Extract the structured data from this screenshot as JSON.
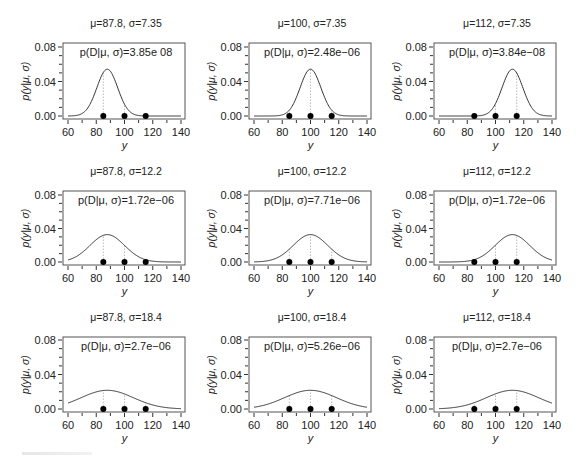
{
  "figure": {
    "rows": 3,
    "cols": 3,
    "colors": {
      "curve": "#333333",
      "axis": "#333333",
      "box": "#555555",
      "dots": "#000000",
      "guide": "#bbbbbb",
      "text": "#222222"
    }
  },
  "chart_data": {
    "type": "line",
    "data_points_y": [
      85,
      100,
      115
    ],
    "xlabel": "y",
    "ylabel": "p(y|μ, σ)",
    "xlim": [
      60,
      140
    ],
    "ylim": [
      0,
      0.08
    ],
    "xticks": [
      60,
      80,
      100,
      120,
      140
    ],
    "xtick_labels": [
      "60",
      "80",
      "100",
      "120",
      "140"
    ],
    "yticks": [
      0,
      0.04,
      0.08
    ],
    "ytick_labels": [
      "0.00",
      "0.04",
      "0.08"
    ],
    "grid": false,
    "panels": [
      {
        "row": 0,
        "col": 0,
        "mu": 87.8,
        "sigma": 7.35,
        "title": "μ=87.8, σ=7.35",
        "likelihood": "p(D|μ, σ)=3.85e 08",
        "show_xlabel": true
      },
      {
        "row": 0,
        "col": 1,
        "mu": 100,
        "sigma": 7.35,
        "title": "μ=100, σ=7.35",
        "likelihood": "p(D|μ, σ)=2.48e−06",
        "show_xlabel": true
      },
      {
        "row": 0,
        "col": 2,
        "mu": 112,
        "sigma": 7.35,
        "title": "μ=112, σ=7.35",
        "likelihood": "p(D|μ, σ)=3.84e−08",
        "show_xlabel": true
      },
      {
        "row": 1,
        "col": 0,
        "mu": 87.8,
        "sigma": 12.2,
        "title": "μ=87.8, σ=12.2",
        "likelihood": "p(D|μ, σ)=1.72e−06",
        "show_xlabel": true
      },
      {
        "row": 1,
        "col": 1,
        "mu": 100,
        "sigma": 12.2,
        "title": "μ=100, σ=12.2",
        "likelihood": "p(D|μ, σ)=7.71e−06",
        "show_xlabel": true
      },
      {
        "row": 1,
        "col": 2,
        "mu": 112,
        "sigma": 12.2,
        "title": "μ=112, σ=12.2",
        "likelihood": "p(D|μ, σ)=1.72e−06",
        "show_xlabel": true
      },
      {
        "row": 2,
        "col": 0,
        "mu": 87.8,
        "sigma": 18.4,
        "title": "μ=87.8, σ=18.4",
        "likelihood": "p(D|μ, σ)=2.7e−06",
        "show_xlabel": true
      },
      {
        "row": 2,
        "col": 1,
        "mu": 100,
        "sigma": 18.4,
        "title": "μ=100, σ=18.4",
        "likelihood": "p(D|μ, σ)=5.26e−06",
        "show_xlabel": true
      },
      {
        "row": 2,
        "col": 2,
        "mu": 112,
        "sigma": 18.4,
        "title": "μ=112, σ=18.4",
        "likelihood": "p(D|μ, σ)=2.7e−06",
        "show_xlabel": true
      }
    ]
  },
  "layout": {
    "col_box_left": [
      63,
      249,
      434
    ],
    "col_box_right": [
      185,
      371,
      556
    ],
    "row_box_top": [
      43,
      191,
      337
    ],
    "row_zero_y": [
      116,
      262,
      409
    ],
    "row_top_tick_y": [
      47,
      195,
      340
    ]
  }
}
